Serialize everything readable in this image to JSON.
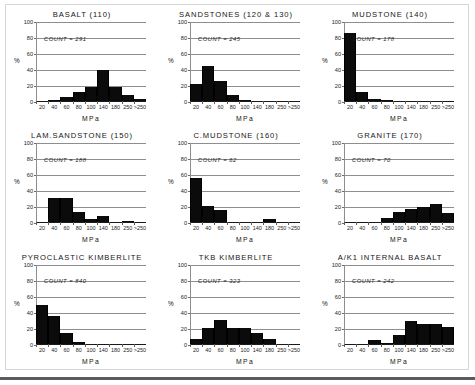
{
  "figure": {
    "xlabel": "MPa",
    "ylabel": "%",
    "ylim": [
      0,
      100
    ],
    "yticks": [
      0,
      20,
      40,
      60,
      80,
      100
    ],
    "ytick_labels": [
      "0",
      "20",
      "40",
      "60",
      "80",
      "100"
    ],
    "xtick_labels": [
      "20",
      "40",
      "60",
      "80",
      "100",
      "140",
      "180",
      "250",
      ">250"
    ],
    "count_prefix": "COUNT = ",
    "grid": true,
    "legend": "none",
    "bar_color": "#0b0b0b",
    "grid_color": "#8e8e8e",
    "axis_color": "#1a1a1a"
  },
  "chart_data": [
    {
      "type": "bar",
      "title": "BASALT (110)",
      "count": 291,
      "count_label": "COUNT = 291",
      "xlabel": "MPa",
      "ylabel": "%",
      "ylim": [
        0,
        100
      ],
      "categories": [
        "20",
        "40",
        "60",
        "80",
        "100",
        "140",
        "180",
        "250",
        ">250"
      ],
      "values": [
        0,
        1,
        5,
        11,
        17,
        39,
        17,
        8,
        2
      ]
    },
    {
      "type": "bar",
      "title": "SANDSTONES (120 & 130)",
      "count": 245,
      "count_label": "COUNT = 245",
      "xlabel": "MPa",
      "ylabel": "%",
      "ylim": [
        0,
        100
      ],
      "categories": [
        "20",
        "40",
        "60",
        "80",
        "100",
        "140",
        "180",
        "250",
        ">250"
      ],
      "values": [
        21,
        44,
        25,
        7,
        1,
        0,
        0,
        0,
        0
      ]
    },
    {
      "type": "bar",
      "title": "MUDSTONE (140)",
      "count": 178,
      "count_label": "COUNT = 178",
      "xlabel": "MPa",
      "ylabel": "%",
      "ylim": [
        0,
        100
      ],
      "categories": [
        "20",
        "40",
        "60",
        "80",
        "100",
        "140",
        "180",
        "250",
        ">250"
      ],
      "values": [
        85,
        11,
        2,
        1,
        0,
        0,
        0,
        0,
        0
      ]
    },
    {
      "type": "bar",
      "title": "LAM.SANDSTONE (150)",
      "count": 188,
      "count_label": "COUNT = 188",
      "xlabel": "MPa",
      "ylabel": "%",
      "ylim": [
        0,
        100
      ],
      "categories": [
        "20",
        "40",
        "60",
        "80",
        "100",
        "140",
        "180",
        "250",
        ">250"
      ],
      "values": [
        1,
        31,
        31,
        13,
        4,
        8,
        1,
        2,
        1
      ]
    },
    {
      "type": "bar",
      "title": "C.MUDSTONE (160)",
      "count": 62,
      "count_label": "COUNT = 62",
      "xlabel": "MPa",
      "ylabel": "%",
      "ylim": [
        0,
        100
      ],
      "categories": [
        "20",
        "40",
        "60",
        "80",
        "100",
        "140",
        "180",
        "250",
        ">250"
      ],
      "values": [
        55,
        20,
        16,
        1,
        0,
        0,
        4,
        1,
        0
      ]
    },
    {
      "type": "bar",
      "title": "GRANITE (170)",
      "count": 70,
      "count_label": "COUNT = 70",
      "xlabel": "MPa",
      "ylabel": "%",
      "ylim": [
        0,
        100
      ],
      "categories": [
        "20",
        "40",
        "60",
        "80",
        "100",
        "140",
        "180",
        "250",
        ">250"
      ],
      "values": [
        0,
        1,
        1,
        6,
        13,
        17,
        19,
        23,
        12
      ]
    },
    {
      "type": "bar",
      "title": "PYROCLASTIC KIMBERLITE",
      "count": 840,
      "count_label": "COUNT = 840",
      "xlabel": "MPa",
      "ylabel": "%",
      "ylim": [
        0,
        100
      ],
      "categories": [
        "20",
        "40",
        "60",
        "80",
        "100",
        "140",
        "180",
        "250",
        ">250"
      ],
      "values": [
        48,
        34,
        13,
        2,
        0,
        0,
        0,
        0,
        0
      ]
    },
    {
      "type": "bar",
      "title": "TKB KIMBERLITE",
      "count": 323,
      "count_label": "COUNT = 323",
      "xlabel": "MPa",
      "ylabel": "%",
      "ylim": [
        0,
        100
      ],
      "categories": [
        "20",
        "40",
        "60",
        "80",
        "100",
        "140",
        "180",
        "250",
        ">250"
      ],
      "values": [
        6,
        20,
        30,
        20,
        20,
        13,
        6,
        0,
        0
      ]
    },
    {
      "type": "bar",
      "title": "A/K1 INTERNAL BASALT",
      "count": 242,
      "count_label": "COUNT = 242",
      "xlabel": "MPa",
      "ylabel": "%",
      "ylim": [
        0,
        100
      ],
      "categories": [
        "20",
        "40",
        "60",
        "80",
        "100",
        "140",
        "180",
        "250",
        ">250"
      ],
      "values": [
        0,
        0,
        4,
        1,
        11,
        28,
        25,
        25,
        21
      ]
    }
  ]
}
